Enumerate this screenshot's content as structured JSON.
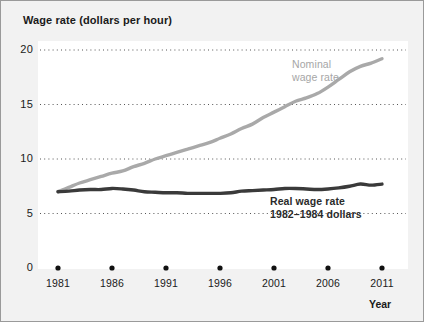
{
  "figure": {
    "background_color": "#f2f2f2",
    "border_color": "#9a9a9a",
    "plot_background_color": "#ffffff"
  },
  "chart_data": {
    "type": "line",
    "title": "Wage rate (dollars per hour)",
    "xlabel": "Year",
    "ylabel": "Wage rate (dollars per hour)",
    "xlim": [
      1981,
      2011
    ],
    "ylim": [
      0,
      20
    ],
    "y_ticks": [
      "20",
      "15",
      "10",
      "5",
      "0"
    ],
    "y_tick_values": [
      20,
      15,
      10,
      5,
      0
    ],
    "x_ticks": [
      "1981",
      "1986",
      "1991",
      "1996",
      "2001",
      "2006",
      "2011"
    ],
    "x_tick_values": [
      1981,
      1986,
      1991,
      1996,
      2001,
      2006,
      2011
    ],
    "grid": "horizontal-dotted",
    "legend_position": "inline-annotations",
    "x": [
      1981,
      1982,
      1983,
      1984,
      1985,
      1986,
      1987,
      1988,
      1989,
      1990,
      1991,
      1992,
      1993,
      1994,
      1995,
      1996,
      1997,
      1998,
      1999,
      2000,
      2001,
      2002,
      2003,
      2004,
      2005,
      2006,
      2007,
      2008,
      2009,
      2010,
      2011
    ],
    "series": [
      {
        "name": "Nominal wage rate",
        "color": "#a9a9a9",
        "label_line_1": "Nominal",
        "label_line_2": "wage rate",
        "values": [
          7.0,
          7.4,
          7.8,
          8.1,
          8.4,
          8.7,
          8.9,
          9.3,
          9.6,
          10.0,
          10.3,
          10.6,
          10.9,
          11.2,
          11.5,
          11.9,
          12.3,
          12.8,
          13.2,
          13.8,
          14.3,
          14.8,
          15.3,
          15.6,
          16.0,
          16.6,
          17.3,
          18.0,
          18.5,
          18.8,
          19.2
        ]
      },
      {
        "name": "Real wage rate, 1982-1984 dollars",
        "color": "#3a3a3a",
        "label_line_1": "Real wage rate",
        "label_line_2": "1982–1984 dollars",
        "values": [
          7.0,
          7.05,
          7.15,
          7.2,
          7.2,
          7.3,
          7.25,
          7.15,
          7.0,
          6.95,
          6.9,
          6.9,
          6.85,
          6.85,
          6.85,
          6.85,
          6.9,
          7.05,
          7.1,
          7.15,
          7.2,
          7.3,
          7.3,
          7.25,
          7.2,
          7.25,
          7.35,
          7.5,
          7.7,
          7.6,
          7.7
        ]
      }
    ]
  }
}
